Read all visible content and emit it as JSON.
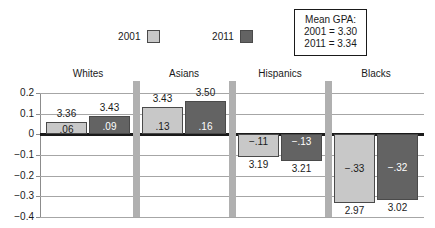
{
  "legend": {
    "entries": [
      {
        "label": "2001",
        "color": "#c8c8c8"
      },
      {
        "label": "2011",
        "color": "#636363"
      }
    ]
  },
  "gpa_box": {
    "title": "Mean GPA:",
    "line1": "2001 = 3.30",
    "line2": "2011 = 3.34"
  },
  "chart_data": {
    "type": "bar",
    "title": "",
    "xlabel": "",
    "ylabel": "",
    "ylim": [
      -0.4,
      0.2
    ],
    "yticks": [
      "0.2",
      "0.1",
      "0",
      "−0.1",
      "−0.2",
      "−0.3",
      "−0.4"
    ],
    "ytick_values": [
      0.2,
      0.1,
      0,
      -0.1,
      -0.2,
      -0.3,
      -0.4
    ],
    "grid": true,
    "legend_position": "top",
    "categories": [
      "Whites",
      "Asians",
      "Hispanics",
      "Blacks"
    ],
    "series": [
      {
        "name": "2001",
        "color": "#c8c8c8",
        "values": [
          0.06,
          0.13,
          -0.11,
          -0.33
        ],
        "bar_labels": [
          ".06",
          ".13",
          "−.11",
          "−.33"
        ],
        "gpa_labels": [
          "3.36",
          "3.43",
          "3.19",
          "2.97"
        ]
      },
      {
        "name": "2011",
        "color": "#636363",
        "values": [
          0.09,
          0.16,
          -0.13,
          -0.32
        ],
        "bar_labels": [
          ".09",
          ".16",
          "−.13",
          "−.32"
        ],
        "gpa_labels": [
          "3.43",
          "3.50",
          "3.21",
          "3.02"
        ]
      }
    ]
  }
}
